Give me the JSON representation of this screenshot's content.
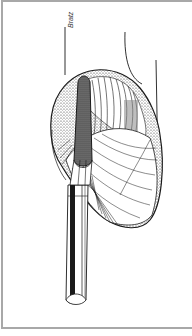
{
  "figure": {
    "signature": "Bratz",
    "colors": {
      "ink": "#1a1a1a",
      "frame": "#a8a8a8",
      "background": "#ffffff",
      "shade": "#555555"
    }
  }
}
